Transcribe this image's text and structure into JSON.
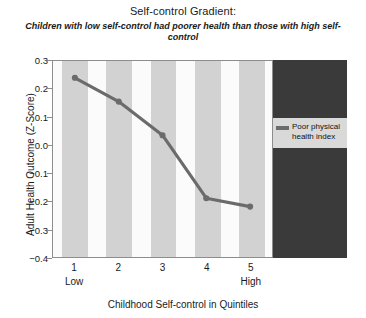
{
  "chart_data": {
    "type": "line",
    "title": "Self-control Gradient:",
    "subtitle": "Children with low self-control had poorer health than those with high self-control",
    "xlabel": "Childhood Self-control in Quintiles",
    "ylabel": "Adult Health Outcome (Z-Score)",
    "categories": [
      "1",
      "2",
      "3",
      "4",
      "5"
    ],
    "category_endpoint_labels": {
      "first": "Low",
      "last": "High"
    },
    "series": [
      {
        "name": "Poor physical health index",
        "color": "#6b6b6b",
        "values": [
          0.24,
          0.155,
          0.035,
          -0.19,
          -0.22
        ]
      }
    ],
    "ylim": [
      -0.4,
      0.3
    ],
    "yticks": [
      "0.3",
      "0.2",
      "0.1",
      "0.0",
      "−0.1",
      "−0.2",
      "−0.3",
      "−0.4"
    ],
    "ytick_values": [
      0.3,
      0.2,
      0.1,
      0.0,
      -0.1,
      -0.2,
      -0.3,
      -0.4
    ],
    "grid": false,
    "legend_position": "right",
    "background_bands": "alternating gray bands centered on each quintile"
  },
  "legend": {
    "entries": [
      {
        "label_line1": "Poor physical",
        "label_line2": "health index",
        "color": "#6b6b6b"
      }
    ]
  }
}
